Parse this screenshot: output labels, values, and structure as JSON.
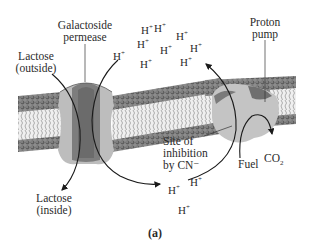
{
  "figure": {
    "caption": "(a)",
    "labels": {
      "permease_line1": "Galactoside",
      "permease_line2": "permease",
      "lactose_out_line1": "Lactose",
      "lactose_out_line2": "(outside)",
      "lactose_in_line1": "Lactose",
      "lactose_in_line2": "(inside)",
      "pump_line1": "Proton",
      "pump_line2": "pump",
      "inhibition_line1": "Site of",
      "inhibition_line2": "inhibition",
      "inhibition_line3": "by CN⁻",
      "fuel": "Fuel",
      "co2_main": "CO",
      "co2_sub": "2"
    },
    "proton_symbol": "H",
    "proton_charge": "+",
    "protons_outside_count": 9,
    "protons_inside_count": 3,
    "colors": {
      "membrane_heads": "#6a6a6a",
      "membrane_tails": "#d9d9d9",
      "protein_light": "#bdbdbd",
      "protein_dark": "#7d7d7d",
      "arrow": "#1a1a1a"
    }
  }
}
